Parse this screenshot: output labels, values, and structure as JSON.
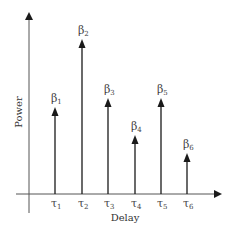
{
  "diagram": {
    "type": "power-delay-profile",
    "y_axis": {
      "label": "Power"
    },
    "x_axis": {
      "label": "Delay"
    },
    "colors": {
      "line": "#1a1a1a",
      "text": "#444444"
    },
    "taps": [
      {
        "delay_symbol": "τ",
        "delay_sub": "1",
        "gain_symbol": "β",
        "gain_sub": "1",
        "x": 55,
        "top": 108
      },
      {
        "delay_symbol": "τ",
        "delay_sub": "2",
        "gain_symbol": "β",
        "gain_sub": "2",
        "x": 82,
        "top": 40
      },
      {
        "delay_symbol": "τ",
        "delay_sub": "3",
        "gain_symbol": "β",
        "gain_sub": "3",
        "x": 108,
        "top": 99
      },
      {
        "delay_symbol": "τ",
        "delay_sub": "4",
        "gain_symbol": "β",
        "gain_sub": "4",
        "x": 135,
        "top": 136
      },
      {
        "delay_symbol": "τ",
        "delay_sub": "5",
        "gain_symbol": "β",
        "gain_sub": "5",
        "x": 161,
        "top": 99
      },
      {
        "delay_symbol": "τ",
        "delay_sub": "6",
        "gain_symbol": "β",
        "gain_sub": "6",
        "x": 187,
        "top": 154
      }
    ]
  }
}
